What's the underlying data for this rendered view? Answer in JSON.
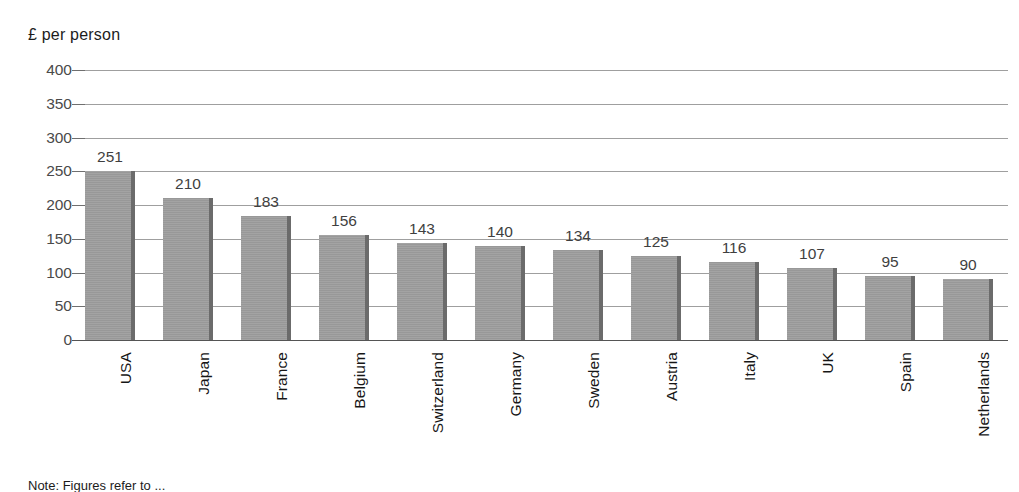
{
  "chart_data": {
    "type": "bar",
    "title": "£ per person",
    "xlabel": "",
    "ylabel": "£ per person",
    "ylim": [
      0,
      400
    ],
    "ytick_step": 50,
    "grid": true,
    "legend": null,
    "orientation": "vertical",
    "categories": [
      "USA",
      "Japan",
      "France",
      "Belgium",
      "Switzerland",
      "Germany",
      "Sweden",
      "Austria",
      "Italy",
      "UK",
      "Spain",
      "Netherlands"
    ],
    "values": [
      251,
      210,
      183,
      156,
      143,
      140,
      134,
      125,
      116,
      107,
      95,
      90
    ],
    "ytick_labels": [
      "400",
      "350",
      "300",
      "250",
      "200",
      "150",
      "100",
      "50",
      "0"
    ],
    "ytick_values": [
      400,
      350,
      300,
      250,
      200,
      150,
      100,
      50,
      0
    ],
    "bar_color": "#9e9e9e",
    "bar_edge_color": "#6b6b6b",
    "gridline_color": "#8e8e8e",
    "text_color": "#1c1c1c",
    "value_labels_shown": true
  },
  "footnote": {
    "text": "Note: Figures refer to ..."
  }
}
